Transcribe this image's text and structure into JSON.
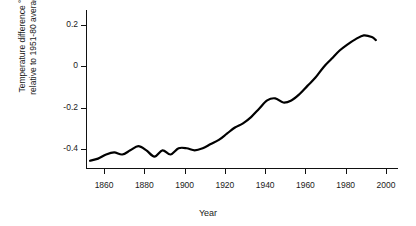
{
  "chart_data": {
    "type": "line",
    "title": "",
    "xlabel": "Year",
    "ylabel": "Temperature difference °C relative to 1951-80 average",
    "ylabel_line1": "Temperature difference °C",
    "ylabel_line2": "relative to 1951-80 average",
    "xlim": [
      1851,
      2006
    ],
    "ylim": [
      -0.49,
      0.27
    ],
    "xticks": [
      1860,
      1880,
      1900,
      1920,
      1940,
      1960,
      1980,
      2000
    ],
    "xticklabels": [
      "1860",
      "1880",
      "1900",
      "1920",
      "1940",
      "1960",
      "1980",
      "2000"
    ],
    "yticks": [
      0.2,
      0,
      -0.2,
      -0.4
    ],
    "yticklabels": [
      "0.2",
      "0",
      "-0.2",
      "-0.4"
    ],
    "grid": false,
    "legend": false,
    "line_color": "#000000",
    "line_width": 2.2,
    "series": [
      {
        "name": "Global temperature anomaly",
        "x": [
          1853,
          1857,
          1861,
          1865,
          1869,
          1873,
          1877,
          1881,
          1885,
          1889,
          1893,
          1897,
          1901,
          1905,
          1909,
          1913,
          1917,
          1921,
          1925,
          1929,
          1933,
          1937,
          1941,
          1945,
          1949,
          1953,
          1957,
          1961,
          1965,
          1969,
          1973,
          1977,
          1981,
          1985,
          1989,
          1993,
          1995
        ],
        "y": [
          -0.455,
          -0.445,
          -0.425,
          -0.415,
          -0.425,
          -0.405,
          -0.385,
          -0.405,
          -0.435,
          -0.405,
          -0.425,
          -0.395,
          -0.395,
          -0.405,
          -0.395,
          -0.375,
          -0.355,
          -0.325,
          -0.295,
          -0.275,
          -0.245,
          -0.205,
          -0.165,
          -0.155,
          -0.175,
          -0.165,
          -0.135,
          -0.095,
          -0.055,
          -0.005,
          0.035,
          0.075,
          0.105,
          0.13,
          0.148,
          0.14,
          0.125
        ]
      }
    ]
  },
  "axes": {
    "x_pixel_start": 86,
    "x_pixel_end": 398,
    "y_pixel_top": 10,
    "y_pixel_bottom": 168
  }
}
